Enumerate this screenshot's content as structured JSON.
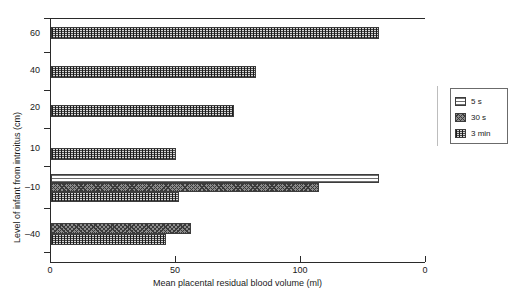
{
  "chart_data": {
    "type": "bar",
    "orientation": "horizontal",
    "title": "",
    "xlabel": "Mean placental residual blood volume (ml)",
    "ylabel": "Level of infant from introitus (cm)",
    "xlim": [
      0,
      150
    ],
    "xticks": [
      0,
      50,
      100,
      150
    ],
    "xtick_labels": [
      "0",
      "50",
      "100",
      "0"
    ],
    "categories": [
      "60",
      "40",
      "20",
      "10",
      "-10",
      "-40"
    ],
    "ytick_labels": [
      "60",
      "40",
      "20",
      "10",
      "–10",
      "–40"
    ],
    "grid": false,
    "legend_position": "right",
    "series": [
      {
        "name": "5 s",
        "pattern": "horizontal-lines-light",
        "values": [
          null,
          null,
          null,
          null,
          131,
          null
        ]
      },
      {
        "name": "30 s",
        "pattern": "cross-hatch-grey",
        "values": [
          null,
          null,
          null,
          null,
          107,
          56
        ]
      },
      {
        "name": "3 min",
        "pattern": "checker-dark",
        "values": [
          131,
          82,
          73,
          50,
          51,
          46
        ]
      }
    ]
  },
  "axes": {
    "y": {
      "title": "Level of infant from introitus (cm)",
      "ticks": [
        {
          "label": "60",
          "top": 33
        },
        {
          "label": "40",
          "top": 70
        },
        {
          "label": "20",
          "top": 107
        },
        {
          "label": "10",
          "top": 148
        },
        {
          "label": "–10",
          "top": 187
        },
        {
          "label": "–40",
          "top": 234
        }
      ]
    },
    "x": {
      "title": "Mean placental residual blood volume (ml)",
      "ticks": [
        {
          "label": "0",
          "left": 50
        },
        {
          "label": "50",
          "left": 175
        },
        {
          "label": "100",
          "left": 300
        },
        {
          "label": "0",
          "left": 425
        }
      ]
    }
  },
  "legend": {
    "items": [
      {
        "label": "5 s",
        "pattern": "pat-5s"
      },
      {
        "label": "30 s",
        "pattern": "pat-30s"
      },
      {
        "label": "3 min",
        "pattern": "pat-3min"
      }
    ]
  },
  "bars": [
    {
      "series": "3 min",
      "category": "60",
      "value": 131,
      "top": 27,
      "height": 12,
      "pattern": "pat-3min"
    },
    {
      "series": "3 min",
      "category": "40",
      "value": 82,
      "top": 66,
      "height": 12,
      "pattern": "pat-3min"
    },
    {
      "series": "3 min",
      "category": "20",
      "value": 73,
      "top": 105,
      "height": 12,
      "pattern": "pat-3min"
    },
    {
      "series": "3 min",
      "category": "10",
      "value": 50,
      "top": 148,
      "height": 12,
      "pattern": "pat-3min"
    },
    {
      "series": "5 s",
      "category": "-10",
      "value": 131,
      "top": 174,
      "height": 9,
      "pattern": "pat-5s"
    },
    {
      "series": "30 s",
      "category": "-10",
      "value": 107,
      "top": 183,
      "height": 9,
      "pattern": "pat-30s"
    },
    {
      "series": "3 min",
      "category": "-10",
      "value": 51,
      "top": 192,
      "height": 10,
      "pattern": "pat-3min"
    },
    {
      "series": "30 s",
      "category": "-40",
      "value": 56,
      "top": 223,
      "height": 11,
      "pattern": "pat-30s"
    },
    {
      "series": "3 min",
      "category": "-40",
      "value": 46,
      "top": 234,
      "height": 11,
      "pattern": "pat-3min"
    }
  ]
}
